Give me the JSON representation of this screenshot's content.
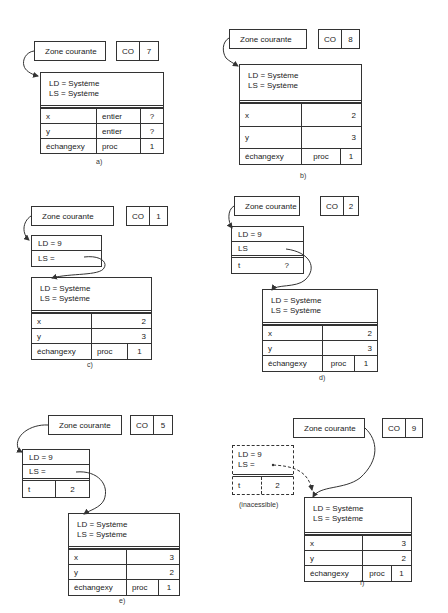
{
  "labels": {
    "zone": "Zone courante",
    "co": "CO",
    "ld_sys": "LD = Système",
    "ls_sys": "LS = Système",
    "ld9": "LD = 9",
    "ls_eq": "LS =",
    "ls": "LS",
    "inaccessible": "(inacessible)"
  },
  "panels": {
    "a": {
      "caption": "a)",
      "co_value": "7",
      "rows": [
        {
          "name": "x",
          "type": "entier",
          "value": "?"
        },
        {
          "name": "y",
          "type": "entier",
          "value": "?"
        },
        {
          "name": "échangexy",
          "type": "proc",
          "value": "1"
        }
      ]
    },
    "b": {
      "caption": "b)",
      "co_value": "8",
      "rows": [
        {
          "name": "x",
          "value": "2"
        },
        {
          "name": "y",
          "value": "3"
        },
        {
          "name": "échangexy",
          "type": "proc",
          "value": "1"
        }
      ]
    },
    "c": {
      "caption": "c)",
      "co_value": "1",
      "rows": [
        {
          "name": "x",
          "value": "2"
        },
        {
          "name": "y",
          "value": "3"
        },
        {
          "name": "échangexy",
          "type": "proc",
          "value": "1"
        }
      ]
    },
    "d": {
      "caption": "d)",
      "co_value": "2",
      "local": {
        "name": "t",
        "value": "?"
      },
      "rows": [
        {
          "name": "x",
          "value": "2"
        },
        {
          "name": "y",
          "value": "3"
        },
        {
          "name": "échangexy",
          "type": "proc",
          "value": "1"
        }
      ]
    },
    "e": {
      "caption": "e)",
      "co_value": "5",
      "local": {
        "name": "t",
        "value": "2"
      },
      "rows": [
        {
          "name": "x",
          "value": "3"
        },
        {
          "name": "y",
          "value": "2"
        },
        {
          "name": "échangexy",
          "type": "proc",
          "value": "1"
        }
      ]
    },
    "f": {
      "caption": "f)",
      "co_value": "9",
      "local": {
        "name": "t",
        "value": "2"
      },
      "rows": [
        {
          "name": "x",
          "value": "3"
        },
        {
          "name": "y",
          "value": "2"
        },
        {
          "name": "échangexy",
          "type": "proc",
          "value": "1"
        }
      ]
    }
  }
}
